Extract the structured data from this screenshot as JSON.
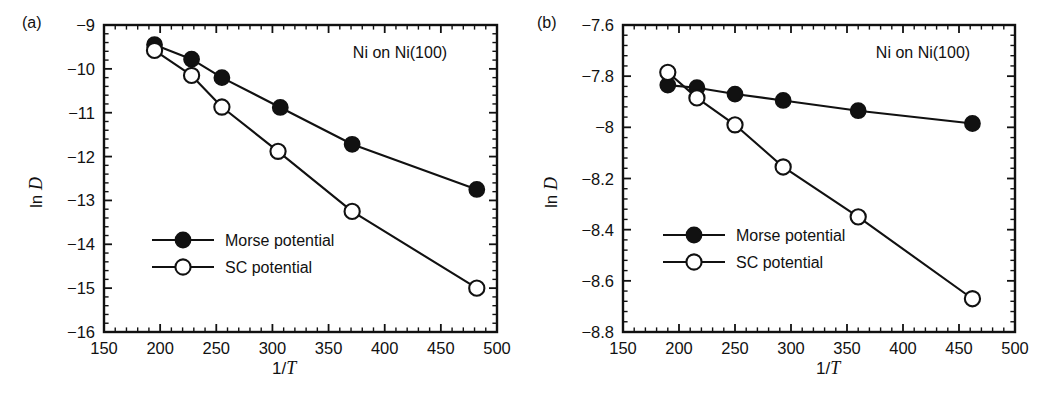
{
  "figure": {
    "panels": [
      {
        "tag": "(a)",
        "annotation": "Ni on Ni(100)",
        "xlabel_prefix": "1/",
        "xlabel_var": "T",
        "ylabel_prefix": "ln ",
        "ylabel_var": "D",
        "legend": [
          {
            "label": "Morse potential",
            "marker": "filled-circle"
          },
          {
            "label": "SC potential",
            "marker": "open-circle"
          }
        ],
        "xticks": [
          "150",
          "200",
          "250",
          "300",
          "350",
          "400",
          "450",
          "500"
        ],
        "yticks": [
          "−9",
          "−10",
          "−11",
          "−12",
          "−13",
          "−14",
          "−15",
          "−16"
        ]
      },
      {
        "tag": "(b)",
        "annotation": "Ni on Ni(100)",
        "xlabel_prefix": "1/",
        "xlabel_var": "T",
        "ylabel_prefix": "ln ",
        "ylabel_var": "D",
        "legend": [
          {
            "label": "Morse potential",
            "marker": "filled-circle"
          },
          {
            "label": "SC potential",
            "marker": "open-circle"
          }
        ],
        "xticks": [
          "150",
          "200",
          "250",
          "300",
          "350",
          "400",
          "450",
          "500"
        ],
        "yticks": [
          "−7.6",
          "−7.8",
          "−8",
          "−8.2",
          "−8.4",
          "−8.6",
          "−8.8"
        ]
      }
    ]
  },
  "chart_data": [
    {
      "type": "scatter",
      "panel": "(a)",
      "title": "Ni on Ni(100)",
      "xlabel": "1/T",
      "ylabel": "ln D",
      "xlim": [
        150,
        500
      ],
      "ylim": [
        -16,
        -9
      ],
      "xticks": [
        150,
        200,
        250,
        300,
        350,
        400,
        450,
        500
      ],
      "yticks": [
        -16,
        -15,
        -14,
        -13,
        -12,
        -11,
        -10,
        -9
      ],
      "minor_ticks_per_interval": 5,
      "grid": false,
      "legend_position": "lower-left-inside",
      "series": [
        {
          "name": "Morse potential",
          "marker": "filled-circle",
          "line": "solid",
          "x": [
            195,
            228,
            255,
            307,
            371,
            482
          ],
          "y": [
            -9.45,
            -9.78,
            -10.2,
            -10.88,
            -11.72,
            -12.75
          ]
        },
        {
          "name": "SC potential",
          "marker": "open-circle",
          "line": "solid",
          "x": [
            195,
            228,
            255,
            305,
            371,
            482
          ],
          "y": [
            -9.58,
            -10.15,
            -10.87,
            -11.88,
            -13.25,
            -15.0
          ]
        }
      ]
    },
    {
      "type": "scatter",
      "panel": "(b)",
      "title": "Ni on Ni(100)",
      "xlabel": "1/T",
      "ylabel": "ln D",
      "xlim": [
        150,
        500
      ],
      "ylim": [
        -8.8,
        -7.6
      ],
      "xticks": [
        150,
        200,
        250,
        300,
        350,
        400,
        450,
        500
      ],
      "yticks": [
        -8.8,
        -8.6,
        -8.4,
        -8.2,
        -8.0,
        -7.8,
        -7.6
      ],
      "minor_ticks_per_interval": 5,
      "grid": false,
      "legend_position": "lower-left-inside",
      "series": [
        {
          "name": "Morse potential",
          "marker": "filled-circle",
          "line": "solid",
          "x": [
            190,
            216,
            250,
            293,
            360,
            462
          ],
          "y": [
            -7.835,
            -7.845,
            -7.87,
            -7.895,
            -7.935,
            -7.985
          ]
        },
        {
          "name": "SC potential",
          "marker": "open-circle",
          "line": "solid",
          "x": [
            190,
            216,
            250,
            293,
            360,
            462
          ],
          "y": [
            -7.785,
            -7.885,
            -7.99,
            -8.155,
            -8.35,
            -8.67
          ]
        }
      ]
    }
  ]
}
